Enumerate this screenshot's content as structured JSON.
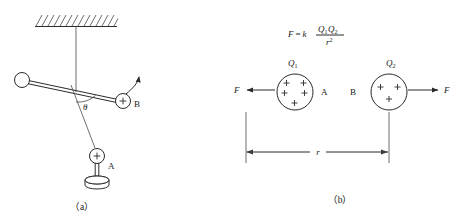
{
  "figure": {
    "background_color": "#ffffff",
    "line_color": "#2b2b2b",
    "panels": [
      {
        "id": "panel-a",
        "caption": "（a）",
        "description": "pendulum rod with charged ball B near fixed charge A",
        "labels": {
          "angle": "θ",
          "ball_b": "B",
          "charge_a": "A",
          "charge_sign": "+"
        }
      },
      {
        "id": "panel-b",
        "caption": "（b）",
        "description": "two point charges repelling with Coulomb force",
        "formula": {
          "lhs": "F",
          "equals": "=",
          "constant": "k",
          "numerator_q1": "Q",
          "numerator_q1_sub": "1",
          "numerator_q2": "Q",
          "numerator_q2_sub": "2",
          "denominator_r": "r",
          "denominator_exp": "2"
        },
        "labels": {
          "charge_left_symbol": "Q",
          "charge_left_sub": "1",
          "charge_left_name": "A",
          "charge_right_symbol": "Q",
          "charge_right_sub": "2",
          "charge_right_name": "B",
          "force_left": "F",
          "force_right": "F",
          "distance": "r",
          "charge_sign": "+"
        }
      }
    ]
  }
}
